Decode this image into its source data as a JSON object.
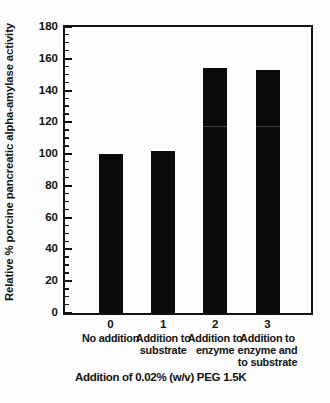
{
  "figure": {
    "background": "#fcfcfc",
    "frame_color": "#141414",
    "text_color": "#121212"
  },
  "chart_data": {
    "type": "bar",
    "title": "",
    "ylabel": "Relative % porcine pancreatic alpha-amylase activity",
    "xlabel": "Addition of 0.02% (w/v) PEG 1.5K",
    "ylim": [
      0,
      180
    ],
    "ytick_interval": 20,
    "minor_tick_interval": 5,
    "ytick_labels": [
      "0",
      "20",
      "40",
      "60",
      "80",
      "100",
      "120",
      "140",
      "160",
      "180"
    ],
    "x_tick_labels": [
      "0",
      "1",
      "2",
      "3"
    ],
    "categories": [
      "No addition",
      "Addition to substrate",
      "Addition to enzyme",
      "Addition to enzyme and to substrate"
    ],
    "category_label_lines": [
      [
        "No addition"
      ],
      [
        "Addition to",
        "substrate"
      ],
      [
        "Addition to",
        "enzyme"
      ],
      [
        "Addition to",
        "enzyme and",
        "to substrate"
      ]
    ],
    "values": [
      100,
      102,
      154,
      153
    ],
    "bar_color": "#0a0a0a",
    "grid": false,
    "legend": "none",
    "scan_artifact_line": {
      "value": 117,
      "bar_indexes": [
        2,
        3
      ]
    }
  }
}
